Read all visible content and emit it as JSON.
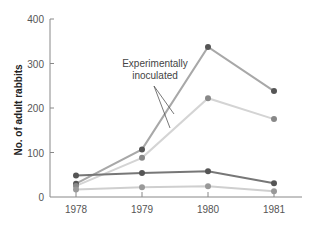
{
  "chart_data": {
    "type": "line",
    "title": "",
    "xlabel": "",
    "ylabel": "No. of adult rabbits",
    "categories": [
      "1978",
      "1979",
      "1980",
      "1981"
    ],
    "yticks": [
      0,
      100,
      200,
      300,
      400
    ],
    "ylim": [
      0,
      400
    ],
    "grid": false,
    "legend": null,
    "annotations": [
      {
        "text_lines": [
          "Experimentally",
          "inoculated"
        ],
        "points_to": [
          "inoculated-dark",
          "inoculated-light"
        ]
      }
    ],
    "series": [
      {
        "name": "inoculated-dark",
        "color": "#a8a8a8",
        "marker_color": "#555555",
        "values": [
          30,
          107,
          337,
          238
        ]
      },
      {
        "name": "inoculated-light",
        "color": "#d4d4d4",
        "marker_color": "#888888",
        "values": [
          25,
          88,
          222,
          175
        ]
      },
      {
        "name": "control-dark",
        "color": "#777777",
        "marker_color": "#555555",
        "values": [
          48,
          54,
          58,
          31
        ]
      },
      {
        "name": "control-light",
        "color": "#cfcfcf",
        "marker_color": "#999999",
        "values": [
          17,
          22,
          24,
          13
        ]
      }
    ]
  }
}
